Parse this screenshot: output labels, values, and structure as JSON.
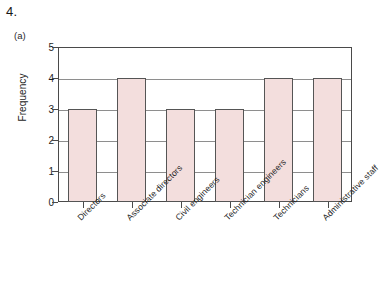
{
  "question": {
    "number": "4.",
    "part": "(a)"
  },
  "chart_data": {
    "type": "bar",
    "title": "",
    "xlabel": "",
    "ylabel": "Frequency",
    "categories": [
      "Directors",
      "Associate directors",
      "Civil engineers",
      "Technician engineers",
      "Technicians",
      "Administrative staff"
    ],
    "values": [
      3,
      4,
      3,
      3,
      4,
      4
    ],
    "ylim": [
      0,
      5
    ],
    "ytick_labels": [
      "0",
      "1",
      "2",
      "3",
      "4",
      "5"
    ],
    "grid": true,
    "legend": false,
    "bar_color": "#f3dedd",
    "bar_border_color": "#555555",
    "axis_color": "#4a4a4a",
    "gridline_color": "#8e8e8e"
  }
}
